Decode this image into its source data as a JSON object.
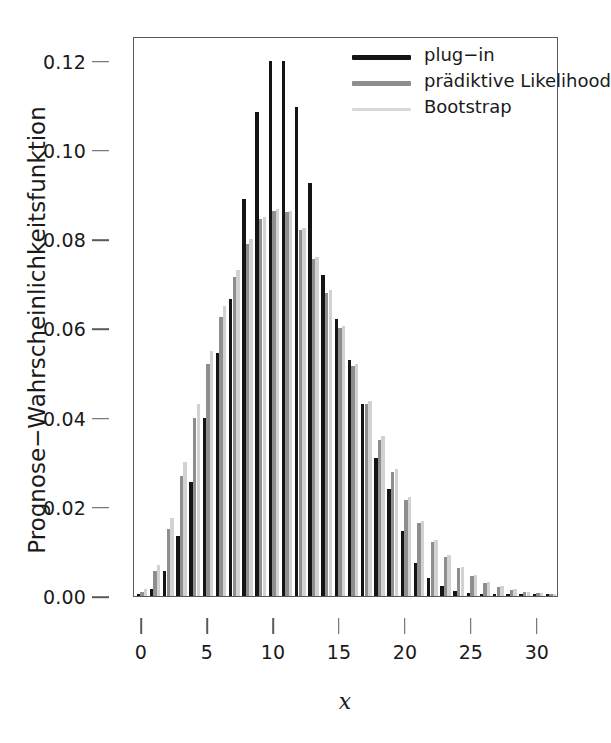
{
  "chart_data": {
    "type": "bar",
    "title": "",
    "xlabel": "x",
    "ylabel": "Prognose−Wahrscheinlichkeitsfunktion",
    "xlim": [
      -0.6,
      31.6
    ],
    "ylim": [
      0.0,
      0.1255
    ],
    "grid": false,
    "legend_position": "top-right",
    "x": [
      0,
      1,
      2,
      3,
      4,
      5,
      6,
      7,
      8,
      9,
      10,
      11,
      12,
      13,
      14,
      15,
      16,
      17,
      18,
      19,
      20,
      21,
      22,
      23,
      24,
      25,
      26,
      27,
      28,
      29,
      30,
      31
    ],
    "xticks": [
      0,
      5,
      10,
      15,
      20,
      25,
      30
    ],
    "xticklabels": [
      "0",
      "5",
      "10",
      "15",
      "20",
      "25",
      "30"
    ],
    "yticks": [
      0.0,
      0.02,
      0.04,
      0.06,
      0.08,
      0.1,
      0.12
    ],
    "yticklabels": [
      "0.00",
      "0.02",
      "0.04",
      "0.06",
      "0.08",
      "0.10",
      "0.12"
    ],
    "series": [
      {
        "name": "plug−in",
        "color": "#141414",
        "values": [
          0.0002,
          0.0015,
          0.0055,
          0.0135,
          0.0255,
          0.04,
          0.0545,
          0.0665,
          0.089,
          0.1085,
          0.1198,
          0.1198,
          0.1095,
          0.0925,
          0.072,
          0.062,
          0.053,
          0.043,
          0.031,
          0.024,
          0.0145,
          0.0075,
          0.004,
          0.0022,
          0.0012,
          0.0007,
          0.0004,
          0.0003,
          0.0002,
          0.0001,
          0.0001,
          0.0
        ]
      },
      {
        "name": "prädiktive Likelihood",
        "color": "#8e8e8e",
        "values": [
          0.001,
          0.0055,
          0.015,
          0.027,
          0.04,
          0.052,
          0.0625,
          0.0715,
          0.079,
          0.0845,
          0.0863,
          0.086,
          0.082,
          0.0755,
          0.068,
          0.06,
          0.0515,
          0.043,
          0.035,
          0.0278,
          0.0215,
          0.0163,
          0.0121,
          0.0088,
          0.0063,
          0.0044,
          0.003,
          0.0021,
          0.0014,
          0.0009,
          0.0006,
          0.0004
        ]
      },
      {
        "name": "Bootstrap",
        "color": "#d2d2d2",
        "values": [
          0.0015,
          0.007,
          0.0175,
          0.03,
          0.043,
          0.0548,
          0.065,
          0.073,
          0.08,
          0.085,
          0.0867,
          0.0862,
          0.0825,
          0.076,
          0.0685,
          0.0605,
          0.052,
          0.0438,
          0.0358,
          0.0285,
          0.0222,
          0.0169,
          0.0126,
          0.0092,
          0.0066,
          0.0047,
          0.0032,
          0.0022,
          0.0015,
          0.001,
          0.0007,
          0.0004
        ]
      }
    ]
  },
  "legend": {
    "entries": [
      {
        "label": "plug−in",
        "color": "#141414"
      },
      {
        "label": "prädiktive Likelihood",
        "color": "#8e8e8e"
      },
      {
        "label": "Bootstrap",
        "color": "#d8d8d8"
      }
    ]
  },
  "caption": ""
}
